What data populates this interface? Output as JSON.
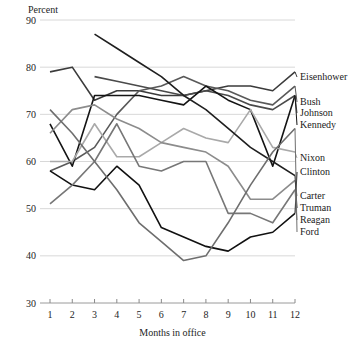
{
  "chart_data": {
    "type": "line",
    "title": "",
    "ylabel": "Percent",
    "xlabel": "Months in office",
    "grid": true,
    "legend_position": "right-inline-labels",
    "x": [
      1,
      2,
      3,
      4,
      5,
      6,
      7,
      8,
      9,
      10,
      11,
      12
    ],
    "xlim": [
      1,
      12
    ],
    "ylim": [
      30,
      90
    ],
    "yticks": [
      30,
      40,
      50,
      60,
      70,
      80,
      90
    ],
    "xticks": [
      1,
      2,
      3,
      4,
      5,
      6,
      7,
      8,
      9,
      10,
      11,
      12
    ],
    "series": [
      {
        "name": "Eisenhower",
        "color": "#3b3b3b",
        "values": [
          79,
          80,
          73,
          75,
          75,
          74,
          74,
          75,
          76,
          76,
          75,
          79
        ]
      },
      {
        "name": "Bush",
        "color": "#595959",
        "values": [
          58,
          60,
          63,
          70,
          75,
          76,
          78,
          76,
          75,
          73,
          72,
          76
        ]
      },
      {
        "name": "Johnson",
        "color": "#4a4a4a",
        "values": [
          null,
          null,
          78,
          77,
          76,
          75,
          74,
          75,
          74,
          72,
          71,
          74
        ]
      },
      {
        "name": "Kennedy",
        "color": "#141414",
        "values": [
          68,
          59,
          74,
          74,
          74,
          73,
          72,
          76,
          73,
          71,
          59,
          74
        ]
      },
      {
        "name": "Nixon",
        "color": "#a9a9a9",
        "values": [
          60,
          60,
          68,
          61,
          61,
          64,
          67,
          65,
          64,
          71,
          63,
          62
        ]
      },
      {
        "name": "Clinton",
        "color": "#111111",
        "values": [
          58,
          55,
          54,
          59,
          55,
          46,
          44,
          42,
          41,
          44,
          45,
          49
        ]
      },
      {
        "name": "Carter",
        "color": "#8c8c8c",
        "values": [
          66,
          71,
          72,
          69,
          67,
          64,
          63,
          62,
          59,
          52,
          52,
          56
        ]
      },
      {
        "name": "Truman",
        "color": "#1f1f1f",
        "values": [
          null,
          null,
          87,
          84,
          81,
          78,
          74,
          71,
          67,
          63,
          60,
          57
        ]
      },
      {
        "name": "Reagan",
        "color": "#777777",
        "values": [
          51,
          55,
          60,
          68,
          59,
          58,
          60,
          60,
          49,
          49,
          47,
          54
        ]
      },
      {
        "name": "Ford",
        "color": "#6e6e6e",
        "values": [
          71,
          66,
          60,
          54,
          47,
          43,
          39,
          40,
          47,
          55,
          62,
          67
        ]
      }
    ],
    "labels_right": [
      {
        "name": "Eisenhower",
        "y": 80
      },
      {
        "name": "Bush",
        "y": 105
      },
      {
        "name": "Johnson",
        "y": 116
      },
      {
        "name": "Kennedy",
        "y": 128
      },
      {
        "name": "Nixon",
        "y": 161
      },
      {
        "name": "Clinton",
        "y": 175
      },
      {
        "name": "Carter",
        "y": 199
      },
      {
        "name": "Truman",
        "y": 211
      },
      {
        "name": "Reagan",
        "y": 223
      },
      {
        "name": "Ford",
        "y": 235
      }
    ]
  }
}
